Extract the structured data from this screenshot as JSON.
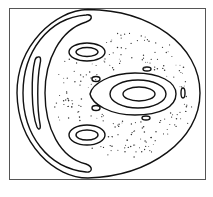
{
  "figure": {
    "type": "poincare-section",
    "stroke_color": "#111111",
    "frame_color": "#555555",
    "background": "#ffffff",
    "frame": {
      "x": 9,
      "y": 8,
      "width": 196,
      "height": 171
    },
    "outer_boundary": {
      "top": [
        88,
        9
      ],
      "left_x": 17,
      "right_x": 200,
      "bottom": [
        88,
        178
      ]
    },
    "islands": [
      {
        "name": "central-island-outer",
        "shape": "teardrop",
        "cx": 135,
        "cy": 94,
        "x_range": [
          90,
          175
        ],
        "y_range": [
          73,
          115
        ]
      },
      {
        "name": "central-island-middle",
        "shape": "ellipse",
        "cx": 138,
        "cy": 94,
        "rx": 28,
        "ry": 14
      },
      {
        "name": "central-island-inner",
        "shape": "ellipse",
        "cx": 138,
        "cy": 94,
        "rx": 16,
        "ry": 7
      },
      {
        "name": "upper-island-outer",
        "shape": "ellipse",
        "cx": 87,
        "cy": 52,
        "rx": 18,
        "ry": 9
      },
      {
        "name": "upper-island-inner",
        "shape": "ellipse",
        "cx": 87,
        "cy": 52,
        "rx": 11,
        "ry": 4.5
      },
      {
        "name": "lower-island-outer",
        "shape": "ellipse",
        "cx": 87,
        "cy": 135,
        "rx": 18,
        "ry": 10
      },
      {
        "name": "lower-island-inner",
        "shape": "ellipse",
        "cx": 87,
        "cy": 135,
        "rx": 11,
        "ry": 5
      },
      {
        "name": "small-island-upper-left",
        "shape": "ellipse",
        "cx": 96,
        "cy": 79,
        "rx": 4,
        "ry": 2.5
      },
      {
        "name": "small-island-lower-left",
        "shape": "ellipse",
        "cx": 96,
        "cy": 108,
        "rx": 4,
        "ry": 2.5
      },
      {
        "name": "small-island-upper-right",
        "shape": "ellipse",
        "cx": 147,
        "cy": 69,
        "rx": 4,
        "ry": 2
      },
      {
        "name": "small-island-lower-right",
        "shape": "ellipse",
        "cx": 146,
        "cy": 118,
        "rx": 4,
        "ry": 2
      },
      {
        "name": "small-island-right",
        "shape": "ellipse",
        "cx": 183,
        "cy": 93,
        "rx": 2,
        "ry": 5
      }
    ],
    "chaotic_region": {
      "dot_count_estimate": 200
    }
  }
}
